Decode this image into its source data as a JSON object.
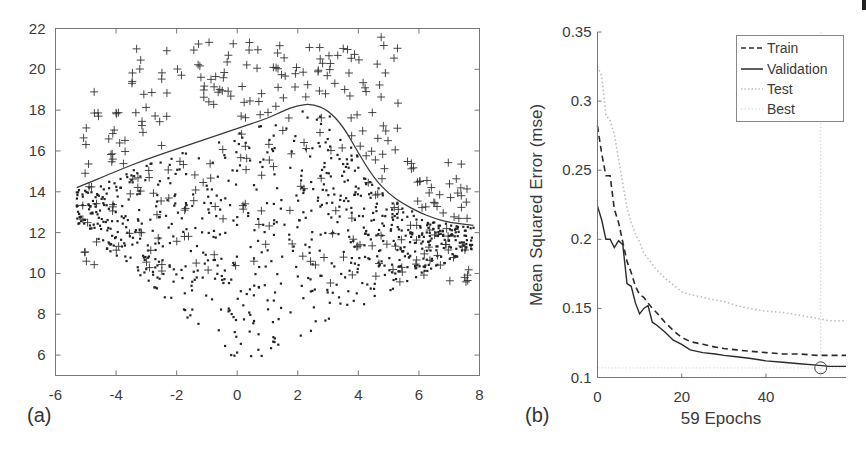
{
  "chart_data": [
    {
      "type": "scatter",
      "panel_label": "(a)",
      "title": "",
      "xlabel": "",
      "ylabel": "",
      "xlim": [
        -6,
        8
      ],
      "ylim": [
        5,
        22
      ],
      "xticks": [
        -6,
        -4,
        -2,
        0,
        2,
        4,
        6,
        8
      ],
      "yticks": [
        6,
        8,
        10,
        12,
        14,
        16,
        18,
        20,
        22
      ],
      "grid": false,
      "legend": null,
      "series": [
        {
          "name": "class-plus",
          "marker": "+",
          "description": "points mostly above the decision boundary (upper region y 12-22)"
        },
        {
          "name": "class-dot",
          "marker": ".",
          "description": "points mostly below the decision boundary (lower region y 5.5-17)"
        },
        {
          "name": "decision-boundary",
          "marker": "line",
          "x": [
            -5.3,
            -4,
            -3,
            -2,
            -1,
            0,
            1,
            1.5,
            2,
            2.5,
            3,
            3.5,
            4,
            4.5,
            5,
            5.5,
            6,
            6.5,
            7,
            7.8
          ],
          "y": [
            14.2,
            15.0,
            15.6,
            16.1,
            16.6,
            17.1,
            17.6,
            17.95,
            18.25,
            18.3,
            18.0,
            17.2,
            15.9,
            14.7,
            13.9,
            13.4,
            13.0,
            12.7,
            12.5,
            12.35
          ]
        }
      ]
    },
    {
      "type": "line",
      "panel_label": "(b)",
      "title": "",
      "xlabel": "59 Epochs",
      "ylabel": "Mean Squared Error  (mse)",
      "xlim": [
        0,
        59
      ],
      "ylim": [
        0.1,
        0.35
      ],
      "xticks": [
        0,
        20,
        40
      ],
      "yticks": [
        0.1,
        0.15,
        0.2,
        0.25,
        0.3,
        0.35
      ],
      "grid": false,
      "legend_position": "top-right",
      "legend": [
        "Train",
        "Validation",
        "Test",
        "Best"
      ],
      "x": [
        0,
        1,
        2,
        3,
        4,
        5,
        6,
        7,
        8,
        9,
        10,
        11,
        12,
        13,
        14,
        16,
        18,
        20,
        22,
        25,
        28,
        30,
        33,
        36,
        40,
        44,
        48,
        52,
        55,
        59
      ],
      "series": [
        {
          "name": "Train",
          "style": "dashed",
          "values": [
            0.282,
            0.262,
            0.246,
            0.246,
            0.222,
            0.212,
            0.198,
            0.184,
            0.176,
            0.166,
            0.16,
            0.158,
            0.154,
            0.15,
            0.147,
            0.14,
            0.134,
            0.129,
            0.126,
            0.124,
            0.122,
            0.121,
            0.12,
            0.119,
            0.118,
            0.117,
            0.117,
            0.116,
            0.116,
            0.116
          ]
        },
        {
          "name": "Validation",
          "style": "solid",
          "values": [
            0.224,
            0.214,
            0.2,
            0.2,
            0.194,
            0.199,
            0.196,
            0.168,
            0.166,
            0.154,
            0.146,
            0.15,
            0.152,
            0.14,
            0.138,
            0.133,
            0.127,
            0.124,
            0.12,
            0.118,
            0.117,
            0.116,
            0.115,
            0.114,
            0.112,
            0.111,
            0.11,
            0.109,
            0.108,
            0.108
          ]
        },
        {
          "name": "Test",
          "style": "dotted",
          "values": [
            0.325,
            0.318,
            0.29,
            0.286,
            0.276,
            0.258,
            0.24,
            0.223,
            0.212,
            0.204,
            0.198,
            0.19,
            0.186,
            0.182,
            0.178,
            0.172,
            0.167,
            0.162,
            0.16,
            0.158,
            0.156,
            0.155,
            0.152,
            0.15,
            0.148,
            0.147,
            0.145,
            0.143,
            0.141,
            0.141
          ]
        },
        {
          "name": "Best",
          "style": "dotted-light",
          "x_best": 53,
          "y_best": 0.107
        }
      ]
    }
  ],
  "figure": {
    "panel_a_label": "(a)",
    "panel_b_label": "(b)",
    "colors": {
      "ink": "#2a2a2a",
      "axis": "#555555",
      "test": "#bdbdbd",
      "best": "#dddddd"
    }
  }
}
